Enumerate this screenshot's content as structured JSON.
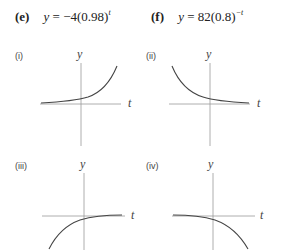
{
  "equations": [
    {
      "id": "e",
      "label": "(e)",
      "lhs": "y",
      "eq": " = −4(0.98)",
      "exp": "t"
    },
    {
      "id": "f",
      "label": "(f)",
      "lhs": "y",
      "eq": " = 82(0.8)",
      "exp": "−t"
    }
  ],
  "panels": [
    {
      "label": "(i)",
      "y_axis_label": "y",
      "x_axis_label": "t",
      "shape": "increasing-positive"
    },
    {
      "label": "(ii)",
      "y_axis_label": "y",
      "x_axis_label": "t",
      "shape": "decreasing-positive"
    },
    {
      "label": "(iii)",
      "y_axis_label": "y",
      "x_axis_label": "t",
      "shape": "increasing-negative"
    },
    {
      "label": "(iv)",
      "y_axis_label": "y",
      "x_axis_label": "t",
      "shape": "decreasing-negative"
    }
  ]
}
